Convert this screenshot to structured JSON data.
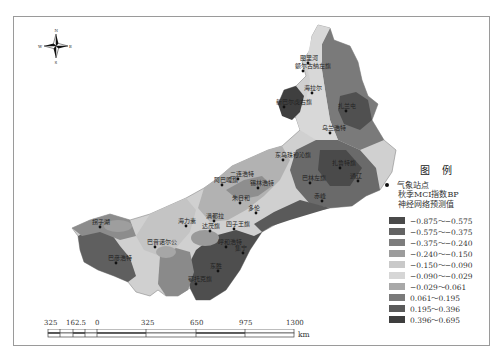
{
  "compass": {
    "n": "N",
    "s": "S",
    "e": "E",
    "w": "W"
  },
  "legend": {
    "title": "图 例",
    "station_label": "气象站点",
    "subtitle_line1": "秋季MCI指数BP",
    "subtitle_line2": "神经网络预测值",
    "classes": [
      {
        "label": "−0.875～−0.575",
        "color": "#4a4a4a"
      },
      {
        "label": "−0.575～−0.375",
        "color": "#636363"
      },
      {
        "label": "−0.375～−0.240",
        "color": "#7d7d7d"
      },
      {
        "label": "−0.240～−0.150",
        "color": "#9c9c9c"
      },
      {
        "label": "−0.150～−0.090",
        "color": "#c9c9c9"
      },
      {
        "label": "−0.090～−0.029",
        "color": "#d6d6d6"
      },
      {
        "label": "−0.029～0.061",
        "color": "#a8a8a8"
      },
      {
        "label": "0.061～0.195",
        "color": "#7a7a7a"
      },
      {
        "label": "0.195～0.396",
        "color": "#5a5a5a"
      },
      {
        "label": "0.396～0.695",
        "color": "#3e3e3e"
      }
    ]
  },
  "scale": {
    "ticks": [
      "325",
      "162.5",
      "0",
      "325",
      "650",
      "975",
      "1300"
    ],
    "unit": "km"
  },
  "places": [
    {
      "name": "图里河",
      "x": 308,
      "y": 60
    },
    {
      "name": "额尔古纳左旗",
      "x": 303,
      "y": 68
    },
    {
      "name": "海拉尔",
      "x": 312,
      "y": 90
    },
    {
      "name": "新巴尔虎右旗",
      "x": 284,
      "y": 104
    },
    {
      "name": "扎兰屯",
      "x": 346,
      "y": 108
    },
    {
      "name": "乌兰浩特",
      "x": 330,
      "y": 130
    },
    {
      "name": "东乌珠穆沁旗",
      "x": 283,
      "y": 157
    },
    {
      "name": "扎鲁特旗",
      "x": 340,
      "y": 165
    },
    {
      "name": "二连浩特",
      "x": 238,
      "y": 176
    },
    {
      "name": "巴林左旗",
      "x": 310,
      "y": 180
    },
    {
      "name": "阿巴嘎旗",
      "x": 222,
      "y": 182
    },
    {
      "name": "锡林浩特",
      "x": 258,
      "y": 185
    },
    {
      "name": "通辽",
      "x": 358,
      "y": 178
    },
    {
      "name": "赤峰",
      "x": 322,
      "y": 198
    },
    {
      "name": "朱日和",
      "x": 240,
      "y": 200
    },
    {
      "name": "多伦",
      "x": 256,
      "y": 210
    },
    {
      "name": "满都拉",
      "x": 214,
      "y": 218
    },
    {
      "name": "海力素",
      "x": 186,
      "y": 223
    },
    {
      "name": "达茂旗",
      "x": 210,
      "y": 228
    },
    {
      "name": "四子王旗",
      "x": 234,
      "y": 226
    },
    {
      "name": "巴音诺尔公",
      "x": 155,
      "y": 244
    },
    {
      "name": "呼和浩特",
      "x": 226,
      "y": 244
    },
    {
      "name": "集宁",
      "x": 243,
      "y": 250
    },
    {
      "name": "拐子湖",
      "x": 100,
      "y": 224
    },
    {
      "name": "巴彦浩特",
      "x": 116,
      "y": 260
    },
    {
      "name": "东胜",
      "x": 218,
      "y": 268
    },
    {
      "name": "鄂托克旗",
      "x": 196,
      "y": 281
    }
  ]
}
